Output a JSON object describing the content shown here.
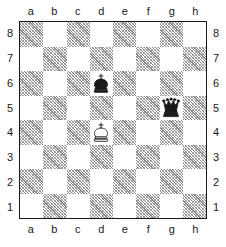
{
  "diagram": {
    "type": "chess-board",
    "orientation": "white-bottom",
    "board_size": 8,
    "dark_square_color": "#8a8a8a",
    "light_square_color": "#ffffff",
    "border_color": "#1a1a1a",
    "dark_square_style": "diagonal-hatch"
  },
  "files": [
    "a",
    "b",
    "c",
    "d",
    "e",
    "f",
    "g",
    "h"
  ],
  "ranks": [
    "8",
    "7",
    "6",
    "5",
    "4",
    "3",
    "2",
    "1"
  ],
  "coordinates": {
    "top": [
      "a",
      "b",
      "c",
      "d",
      "e",
      "f",
      "g",
      "h"
    ],
    "bottom": [
      "a",
      "b",
      "c",
      "d",
      "e",
      "f",
      "g",
      "h"
    ],
    "left": [
      "8",
      "7",
      "6",
      "5",
      "4",
      "3",
      "2",
      "1"
    ],
    "right": [
      "8",
      "7",
      "6",
      "5",
      "4",
      "3",
      "2",
      "1"
    ]
  },
  "pieces": [
    {
      "square": "d6",
      "file": "d",
      "rank": "6",
      "color": "black",
      "type": "king",
      "glyph": "♚",
      "name": "black-king-d6"
    },
    {
      "square": "g5",
      "file": "g",
      "rank": "5",
      "color": "black",
      "type": "queen",
      "glyph": "♛",
      "name": "black-queen-g5"
    },
    {
      "square": "d4",
      "file": "d",
      "rank": "4",
      "color": "white",
      "type": "king",
      "glyph": "♔",
      "name": "white-king-d4"
    }
  ],
  "position": {
    "fen_pieces": "8/8/3k4/6q1/3K4/8/8/8",
    "white_pieces": [
      "Kd4"
    ],
    "black_pieces": [
      "Kd6",
      "Qg5"
    ]
  }
}
